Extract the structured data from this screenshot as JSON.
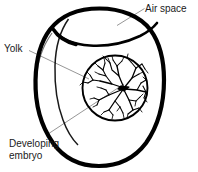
{
  "figure": {
    "background_color": "#ffffff",
    "ink_color": "#000000",
    "leader_line_color": "#8a8a8a"
  },
  "labels": {
    "air_space": "Air space",
    "yolk": "Yolk",
    "developing_embryo_line1": "Developing",
    "developing_embryo_line2": "embryo"
  },
  "parts": [
    {
      "name": "egg-shell-outline",
      "description": "Thick black oval outline of the egg",
      "shape": "oval"
    },
    {
      "name": "air-space-region",
      "description": "Crescent/lens shaped chamber at the top of the egg bounded by the shell above and the inner membrane below",
      "shape": "crescent"
    },
    {
      "name": "yolk-circle",
      "description": "Round yolk in the middle of the egg",
      "shape": "circle"
    },
    {
      "name": "developing-embryo",
      "description": "Branching blood vessel network radiating from the embryo on the yolk surface",
      "shape": "branching-network"
    }
  ],
  "leader_lines": [
    {
      "name": "air-space-leader",
      "from_label": "Air space",
      "to_part": "air-space-region"
    },
    {
      "name": "yolk-leader",
      "from_label": "Yolk",
      "to_part": "yolk-circle"
    },
    {
      "name": "developing-embryo-leader",
      "from_label": "Developing embryo",
      "to_part": "developing-embryo"
    }
  ]
}
